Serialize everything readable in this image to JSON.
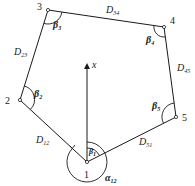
{
  "diagram": {
    "type": "closed traverse polygon",
    "stations": [
      {
        "id": "1",
        "label": "1",
        "x": 87,
        "y": 162
      },
      {
        "id": "2",
        "label": "2",
        "x": 20,
        "y": 100
      },
      {
        "id": "3",
        "label": "3",
        "x": 48,
        "y": 10
      },
      {
        "id": "4",
        "label": "4",
        "x": 164,
        "y": 27
      },
      {
        "id": "5",
        "label": "5",
        "x": 176,
        "y": 117
      }
    ],
    "sides": [
      {
        "from": "1",
        "to": "2",
        "label": "D",
        "sub": "12"
      },
      {
        "from": "2",
        "to": "3",
        "label": "D",
        "sub": "23"
      },
      {
        "from": "3",
        "to": "4",
        "label": "D",
        "sub": "34"
      },
      {
        "from": "4",
        "to": "5",
        "label": "D",
        "sub": "45"
      },
      {
        "from": "5",
        "to": "1",
        "label": "D",
        "sub": "51"
      }
    ],
    "angles": [
      {
        "at": "1",
        "label": "β",
        "sub": "1"
      },
      {
        "at": "2",
        "label": "β",
        "sub": "2"
      },
      {
        "at": "3",
        "label": "β",
        "sub": "3"
      },
      {
        "at": "4",
        "label": "β",
        "sub": "4"
      },
      {
        "at": "5",
        "label": "β",
        "sub": "5"
      }
    ],
    "azimuth": {
      "label": "α",
      "sub": "12"
    },
    "north_axis": {
      "label": "x"
    }
  }
}
